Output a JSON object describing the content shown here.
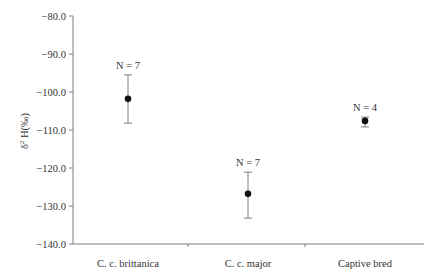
{
  "chart_data": {
    "type": "scatter",
    "subtype": "error-bar",
    "title": "",
    "xlabel": "",
    "ylabel": "δ² H(‰)",
    "ylabel_parts": {
      "delta": "δ",
      "superscript": "2",
      "rest": " H(‰)"
    },
    "ylim": [
      -140.0,
      -80.0
    ],
    "yticks": [
      "-80.0",
      "-90.0",
      "-100.0",
      "-110.0",
      "-120.0",
      "-130.0",
      "-140.0"
    ],
    "ytick_values": [
      -80,
      -90,
      -100,
      -110,
      -120,
      -130,
      -140
    ],
    "grid": false,
    "legend": null,
    "categories": [
      "C. c. brittanica",
      "C. c. major",
      "Captive bred"
    ],
    "series": [
      {
        "name": "mean δ2H",
        "values": [
          -101.8,
          -126.8,
          -107.6
        ],
        "error_upper": [
          -95.5,
          -121.1,
          -106.6
        ],
        "error_lower": [
          -108.2,
          -133.2,
          -109.2
        ],
        "annotations": [
          "N = 7",
          "N = 7",
          "N = 4"
        ]
      }
    ],
    "colors": {
      "axis": "#7f7f7f",
      "marker": "#111111",
      "errorbar": "#7f7f7f",
      "text": "#333333"
    }
  }
}
